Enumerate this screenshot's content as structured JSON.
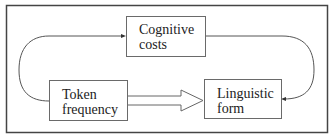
{
  "diagram": {
    "nodes": [
      {
        "id": "cognitive",
        "line1": "Cognitive",
        "line2": "costs"
      },
      {
        "id": "token",
        "line1": "Token",
        "line2": "frequency"
      },
      {
        "id": "linguistic",
        "line1": "Linguistic",
        "line2": "form"
      }
    ],
    "edges": [
      {
        "from": "token",
        "to": "cognitive",
        "style": "curved thin arrow"
      },
      {
        "from": "cognitive",
        "to": "linguistic",
        "style": "curved thin arrow"
      },
      {
        "from": "token",
        "to": "linguistic",
        "style": "hollow block arrow"
      }
    ],
    "colors": {
      "line": "#555555",
      "frame": "#444444",
      "background": "#ffffff"
    }
  }
}
